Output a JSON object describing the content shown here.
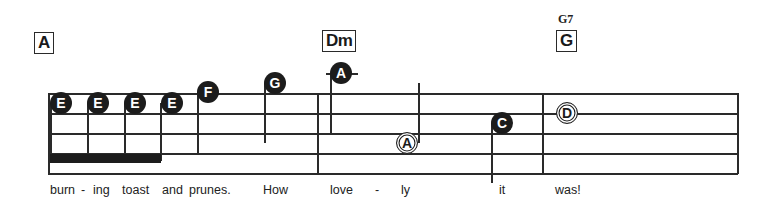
{
  "chords": [
    {
      "name": "A",
      "alt": null
    },
    {
      "name": "Dm",
      "alt": null
    },
    {
      "name": "G",
      "alt": "G7"
    }
  ],
  "notes": [
    {
      "letter": "E",
      "style": "filled"
    },
    {
      "letter": "E",
      "style": "filled"
    },
    {
      "letter": "E",
      "style": "filled"
    },
    {
      "letter": "E",
      "style": "filled"
    },
    {
      "letter": "F",
      "style": "filled"
    },
    {
      "letter": "G",
      "style": "filled"
    },
    {
      "letter": "A",
      "style": "filled"
    },
    {
      "letter": "A",
      "style": "open"
    },
    {
      "letter": "C",
      "style": "filled"
    },
    {
      "letter": "D",
      "style": "open"
    }
  ],
  "lyrics": [
    "burn",
    "-",
    "ing",
    "toast",
    "and",
    "prunes.",
    "How",
    "love",
    "-",
    "ly",
    "it",
    "was!"
  ]
}
